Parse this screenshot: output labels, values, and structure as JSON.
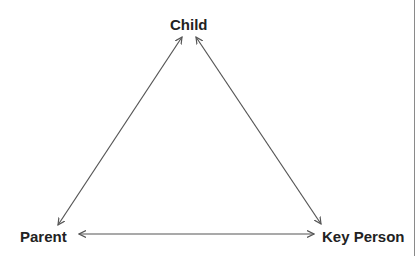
{
  "diagram": {
    "type": "relationship-triangle",
    "nodes": {
      "child": {
        "label": "Child"
      },
      "parent": {
        "label": "Parent"
      },
      "key_person": {
        "label": "Key Person"
      }
    },
    "edges": [
      {
        "from": "parent",
        "to": "child",
        "direction": "both"
      },
      {
        "from": "key_person",
        "to": "child",
        "direction": "both"
      },
      {
        "from": "parent",
        "to": "key_person",
        "direction": "both"
      }
    ],
    "colors": {
      "text": "#222222",
      "arrow": "#555555",
      "border": "#8a8a8a"
    }
  }
}
